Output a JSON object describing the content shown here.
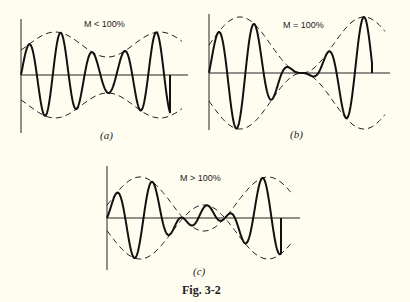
{
  "figure": {
    "caption": "Fig. 3-2",
    "panels": [
      {
        "id": "a",
        "label": "(a)",
        "title": "M < 100%",
        "modulation_index": 0.41,
        "carrier_cycles_per_mod_period": 3.3,
        "mod_periods_shown": 1.15,
        "description": "Amplitude-modulated carrier with modulation below 100%; envelope never reaches zero."
      },
      {
        "id": "b",
        "label": "(b)",
        "title": "M = 100%",
        "modulation_index": 1.0,
        "carrier_cycles_per_mod_period": 3.4,
        "mod_periods_shown": 1.3,
        "description": "Amplitude-modulated carrier at 100% modulation; envelope just touches zero."
      },
      {
        "id": "c",
        "label": "(c)",
        "title": "M > 100%",
        "modulation_index": 1.93,
        "carrier_cycles_per_mod_period": 3.5,
        "mod_periods_shown": 1.35,
        "description": "Overmodulated carrier; envelopes cross over and carrier is distorted near zero."
      }
    ]
  }
}
